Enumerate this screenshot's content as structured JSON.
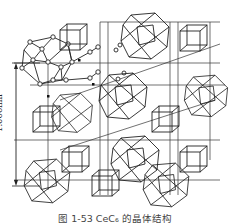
{
  "figure": {
    "dimension_label": "1.066nm",
    "caption": "图 1-53  CeC₆ 的晶体结构",
    "line_color": "#222222",
    "background": "#ffffff"
  },
  "polyhedra": [
    {
      "kind": "cluster-atoms",
      "cx": 47,
      "cy": 62,
      "r": 24
    },
    {
      "kind": "cuboctahedron",
      "cx": 145,
      "cy": 35,
      "r": 24
    },
    {
      "kind": "cuboctahedron",
      "cx": 72,
      "cy": 115,
      "r": 20
    },
    {
      "kind": "cuboctahedron",
      "cx": 123,
      "cy": 95,
      "r": 24
    },
    {
      "kind": "cuboctahedron",
      "cx": 204,
      "cy": 95,
      "r": 22
    },
    {
      "kind": "cuboctahedron",
      "cx": 135,
      "cy": 160,
      "r": 24
    },
    {
      "kind": "cuboctahedron",
      "cx": 49,
      "cy": 178,
      "r": 23
    },
    {
      "kind": "cuboctahedron",
      "cx": 166,
      "cy": 183,
      "r": 23
    }
  ],
  "cubes": [
    {
      "x": 60,
      "y": 26,
      "s": 22
    },
    {
      "x": 180,
      "y": 25,
      "s": 22
    },
    {
      "x": 33,
      "y": 110,
      "s": 20
    },
    {
      "x": 152,
      "y": 110,
      "s": 22
    },
    {
      "x": 62,
      "y": 150,
      "s": 22
    },
    {
      "x": 180,
      "y": 150,
      "s": 22
    },
    {
      "x": 92,
      "y": 170,
      "s": 22
    }
  ]
}
